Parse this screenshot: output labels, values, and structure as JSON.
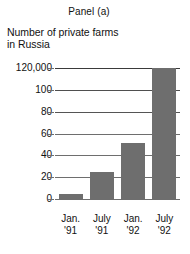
{
  "figure": {
    "panel_title": "Panel (a)",
    "subtitle_line1": "Number of private farms",
    "subtitle_line2": "in Russia",
    "bar_color": "#6e6e6e",
    "grid_color": "#6e6e6e",
    "background": "#ffffff"
  },
  "chart_data": {
    "type": "bar",
    "title": "Panel (a)",
    "subtitle": "Number of private farms in Russia",
    "categories": [
      "Jan. '91",
      "July '91",
      "Jan. '92",
      "July '92"
    ],
    "category_lines": [
      [
        "Jan.",
        "'91"
      ],
      [
        "July",
        "'91"
      ],
      [
        "Jan.",
        "'92"
      ],
      [
        "July",
        "'92"
      ]
    ],
    "values": [
      5,
      25,
      51,
      120
    ],
    "series": [
      {
        "name": "Number of private farms in Russia",
        "values": [
          5,
          25,
          51,
          120
        ]
      }
    ],
    "xlabel": "",
    "ylabel": "",
    "ylim": [
      0,
      120
    ],
    "yticks": [
      0,
      20,
      40,
      60,
      80,
      100,
      120
    ],
    "ytick_labels": [
      "0",
      "20",
      "40",
      "60",
      "80",
      "100",
      "120,000"
    ],
    "units": "thousands of farms (top tick labelled 120,000)",
    "grid": true,
    "grid_axis": "y",
    "legend": false
  }
}
